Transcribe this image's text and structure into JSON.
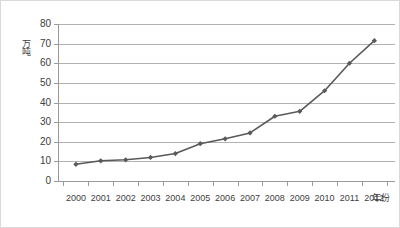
{
  "chart_data": {
    "type": "line",
    "title": "",
    "xlabel": "年份",
    "ylabel": "万吨",
    "categories": [
      "2000",
      "2001",
      "2002",
      "2003",
      "2004",
      "2005",
      "2006",
      "2007",
      "2008",
      "2009",
      "2010",
      "2011",
      "2012"
    ],
    "values": [
      8.5,
      10.3,
      10.8,
      12.0,
      14.0,
      19.0,
      21.5,
      24.5,
      33.0,
      35.5,
      46.0,
      60.0,
      71.5
    ],
    "series": [
      {
        "name": "产量",
        "values": [
          8.5,
          10.3,
          10.8,
          12.0,
          14.0,
          19.0,
          21.5,
          24.5,
          33.0,
          35.5,
          46.0,
          60.0,
          71.5
        ]
      }
    ],
    "ylim": [
      0,
      80
    ],
    "yticks": [
      0,
      10,
      20,
      30,
      40,
      50,
      60,
      70,
      80
    ],
    "ytick_labels": [
      "0",
      "10",
      "20",
      "30",
      "40",
      "50",
      "60",
      "70",
      "80"
    ],
    "grid": "horizontal",
    "legend": "none",
    "marker": "diamond",
    "line_color": "#595959",
    "marker_color": "#595959",
    "gridline_color": "#b3b3b3",
    "axis_color": "#9a9a9a",
    "border_color": "#d9d9d9",
    "background_color": "#ffffff"
  }
}
